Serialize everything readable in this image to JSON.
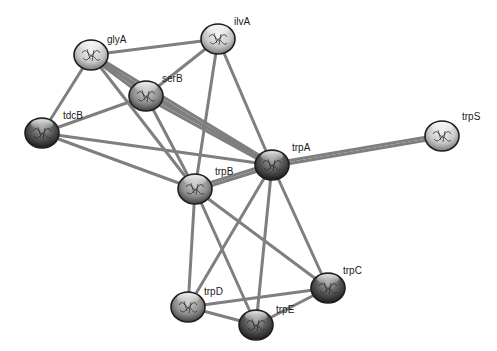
{
  "diagram": {
    "type": "protein-interaction-network",
    "colors": {
      "background": "#ffffff",
      "edge": "#7f7f7f",
      "node_light": "#e6e6e6",
      "node_mid": "#9a9a9a",
      "node_dark": "#3c3c3c",
      "node_outline": "#1e1e1e",
      "label": "#1a1a1a"
    },
    "nodes": [
      {
        "id": "glyA",
        "label": "glyA",
        "x": 91,
        "y": 55,
        "shade": "light",
        "label_dx": 16,
        "label_dy": -12
      },
      {
        "id": "ilvA",
        "label": "ilvA",
        "x": 218,
        "y": 39,
        "shade": "light",
        "label_dx": 16,
        "label_dy": -14
      },
      {
        "id": "serB",
        "label": "serB",
        "x": 146,
        "y": 96,
        "shade": "mid",
        "label_dx": 16,
        "label_dy": -14
      },
      {
        "id": "tdcB",
        "label": "tdcB",
        "x": 42,
        "y": 133,
        "shade": "dark",
        "label_dx": 21,
        "label_dy": -14
      },
      {
        "id": "trpA",
        "label": "trpA",
        "x": 272,
        "y": 165,
        "shade": "dark",
        "label_dx": 20,
        "label_dy": -14
      },
      {
        "id": "trpS",
        "label": "trpS",
        "x": 442,
        "y": 136,
        "shade": "light",
        "label_dx": 20,
        "label_dy": -16
      },
      {
        "id": "trpB",
        "label": "trpB",
        "x": 195,
        "y": 189,
        "shade": "mid",
        "label_dx": 20,
        "label_dy": -14
      },
      {
        "id": "trpC",
        "label": "trpC",
        "x": 328,
        "y": 288,
        "shade": "dark",
        "label_dx": 15,
        "label_dy": -14
      },
      {
        "id": "trpD",
        "label": "trpD",
        "x": 188,
        "y": 307,
        "shade": "mid",
        "label_dx": 16,
        "label_dy": -12
      },
      {
        "id": "trpE",
        "label": "trpE",
        "x": 256,
        "y": 325,
        "shade": "dark",
        "label_dx": 20,
        "label_dy": -12
      }
    ],
    "edges": [
      {
        "source": "glyA",
        "target": "ilvA",
        "weight": 1
      },
      {
        "source": "glyA",
        "target": "serB",
        "weight": 2
      },
      {
        "source": "glyA",
        "target": "tdcB",
        "weight": 1
      },
      {
        "source": "glyA",
        "target": "trpB",
        "weight": 1
      },
      {
        "source": "glyA",
        "target": "trpA",
        "weight": 2
      },
      {
        "source": "ilvA",
        "target": "serB",
        "weight": 1
      },
      {
        "source": "ilvA",
        "target": "trpB",
        "weight": 1
      },
      {
        "source": "ilvA",
        "target": "trpA",
        "weight": 1
      },
      {
        "source": "serB",
        "target": "tdcB",
        "weight": 1
      },
      {
        "source": "serB",
        "target": "trpB",
        "weight": 1
      },
      {
        "source": "serB",
        "target": "trpA",
        "weight": 2
      },
      {
        "source": "tdcB",
        "target": "trpA",
        "weight": 1
      },
      {
        "source": "tdcB",
        "target": "trpB",
        "weight": 1
      },
      {
        "source": "trpA",
        "target": "trpS",
        "weight": 2
      },
      {
        "source": "trpA",
        "target": "trpB",
        "weight": 2
      },
      {
        "source": "trpA",
        "target": "trpD",
        "weight": 1
      },
      {
        "source": "trpA",
        "target": "trpE",
        "weight": 1
      },
      {
        "source": "trpA",
        "target": "trpC",
        "weight": 1
      },
      {
        "source": "trpB",
        "target": "trpD",
        "weight": 1
      },
      {
        "source": "trpB",
        "target": "trpE",
        "weight": 1
      },
      {
        "source": "trpB",
        "target": "trpC",
        "weight": 1
      },
      {
        "source": "trpD",
        "target": "trpC",
        "weight": 1
      },
      {
        "source": "trpD",
        "target": "trpE",
        "weight": 1
      },
      {
        "source": "trpE",
        "target": "trpC",
        "weight": 1
      }
    ]
  }
}
